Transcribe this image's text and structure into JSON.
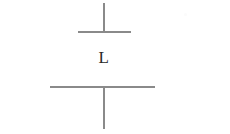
{
  "figure": {
    "type": "circuit-symbol",
    "symbol_name": "capacitor",
    "background_color": "#ffffff",
    "stroke_color": "#8a8a8a",
    "label_color": "#2a2a2a",
    "label": "L",
    "elements": {
      "top_lead": "vertical-lead-line",
      "top_plate": "upper-horizontal-plate",
      "bottom_plate": "lower-horizontal-plate",
      "bottom_lead": "vertical-lead-line",
      "artifact": "faint-speck"
    }
  }
}
